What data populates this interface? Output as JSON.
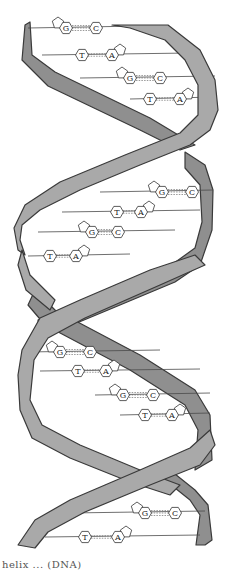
{
  "diagram": {
    "type": "DNA double helix illustration",
    "colors": {
      "ribbon_fill": "#a9a9a9",
      "ribbon_back_fill": "#8f8f8f",
      "outline": "#3a3a3a",
      "background": "#ffffff"
    },
    "base_pairs": [
      {
        "left": "G",
        "right": "C",
        "y": 28
      },
      {
        "left": "T",
        "right": "A",
        "y": 55
      },
      {
        "left": "G",
        "right": "C",
        "y": 78
      },
      {
        "left": "T",
        "right": "A",
        "y": 99
      },
      {
        "left": "G",
        "right": "C",
        "y": 192
      },
      {
        "left": "T",
        "right": "A",
        "y": 212
      },
      {
        "left": "G",
        "right": "C",
        "y": 232
      },
      {
        "left": "T",
        "right": "A",
        "y": 256
      },
      {
        "left": "G",
        "right": "C",
        "y": 352
      },
      {
        "left": "T",
        "right": "A",
        "y": 371
      },
      {
        "left": "G",
        "right": "C",
        "y": 395
      },
      {
        "left": "T",
        "right": "A",
        "y": 415
      },
      {
        "left": "G",
        "right": "C",
        "y": 513
      },
      {
        "left": "T",
        "right": "A",
        "y": 537
      }
    ]
  },
  "caption": "helix ... (DNA)"
}
